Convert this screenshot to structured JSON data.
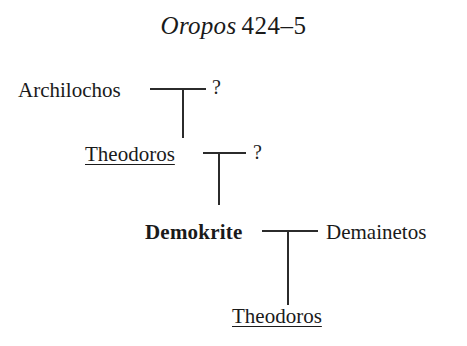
{
  "figure": {
    "title_work": "Oropos",
    "title_years": "424–5"
  },
  "diagram": {
    "type": "genealogical-stemma",
    "generations": [
      {
        "level": 1,
        "left_name": "Archilochos",
        "left_style": "plain",
        "right_name": "?",
        "right_style": "unknown"
      },
      {
        "level": 2,
        "left_name": "Theodoros",
        "left_style": "underlined",
        "right_name": "?",
        "right_style": "unknown"
      },
      {
        "level": 3,
        "left_name": "Demokrite",
        "left_style": "bold",
        "right_name": "Demainetos",
        "right_style": "plain"
      },
      {
        "level": 4,
        "left_name": "Theodoros",
        "left_style": "underlined",
        "right_name": "",
        "right_style": "none"
      }
    ],
    "line_color": "#2b2b2b",
    "background_color": "#ffffff"
  }
}
